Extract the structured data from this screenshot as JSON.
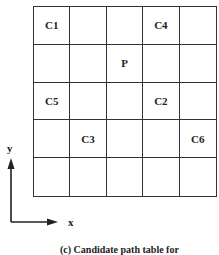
{
  "grid": {
    "rows": 5,
    "cols": 5,
    "cells": [
      [
        "C1",
        "",
        "",
        "C4",
        ""
      ],
      [
        "",
        "",
        "P",
        "",
        ""
      ],
      [
        "C5",
        "",
        "",
        "C2",
        ""
      ],
      [
        "",
        "C3",
        "",
        "",
        "C6"
      ],
      [
        "",
        "",
        "",
        "",
        ""
      ]
    ]
  },
  "axes": {
    "x_label": "x",
    "y_label": "y"
  },
  "caption": "(c) Candidate path table for"
}
